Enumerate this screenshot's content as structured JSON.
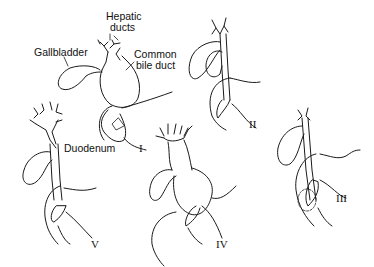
{
  "labels": {
    "hepatic_ducts_1": "Hepatic",
    "hepatic_ducts_2": "ducts",
    "gallbladder": "Gallbladder",
    "common_bile_duct_1": "Common",
    "common_bile_duct_2": "bile duct",
    "duodenum": "Duodenum"
  },
  "types": [
    {
      "numeral": "I"
    },
    {
      "numeral": "II"
    },
    {
      "numeral": "III"
    },
    {
      "numeral": "IV"
    },
    {
      "numeral": "V"
    }
  ],
  "colors": {
    "ink": "#1a1a1a",
    "background": "#ffffff"
  }
}
